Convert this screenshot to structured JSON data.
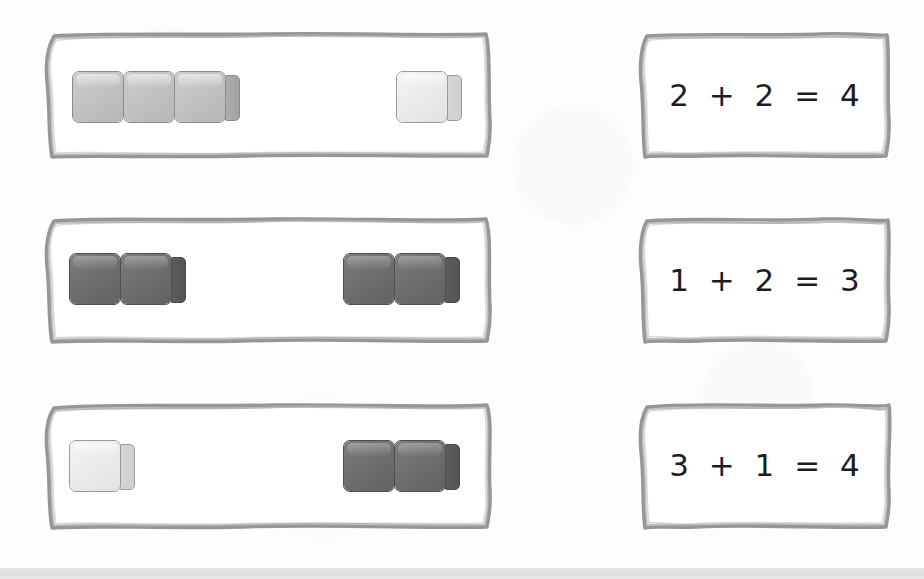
{
  "page": {
    "background_color": "#fdfdfd",
    "bottom_strip_color": "#e0e2e4",
    "sketch_border_color": "#8e9094",
    "text_color": "#1d1d1f"
  },
  "block_tones": {
    "light_label": "light-gray block",
    "light_color": "#ebebeb",
    "mid_label": "medium-gray block",
    "mid_color": "#c2c2c2",
    "dark_label": "dark-gray block",
    "dark_color": "#6f6f6f"
  },
  "rows": [
    {
      "id": "row-1",
      "blocks_box": {
        "name": "blocks-box-1",
        "groups": [
          {
            "name": "group-left",
            "count": 3,
            "tone": "mid",
            "count_label": "3"
          },
          {
            "name": "group-right",
            "count": 1,
            "tone": "light",
            "count_label": "1"
          }
        ]
      },
      "equation_box": {
        "name": "equation-box-1",
        "text": "2 + 2 = 4",
        "addend_a": "2",
        "addend_b": "2",
        "sum": "4"
      }
    },
    {
      "id": "row-2",
      "blocks_box": {
        "name": "blocks-box-2",
        "groups": [
          {
            "name": "group-left",
            "count": 2,
            "tone": "dark",
            "count_label": "2"
          },
          {
            "name": "group-right",
            "count": 2,
            "tone": "dark",
            "count_label": "2"
          }
        ]
      },
      "equation_box": {
        "name": "equation-box-2",
        "text": "1 + 2 = 3",
        "addend_a": "1",
        "addend_b": "2",
        "sum": "3"
      }
    },
    {
      "id": "row-3",
      "blocks_box": {
        "name": "blocks-box-3",
        "groups": [
          {
            "name": "group-left",
            "count": 1,
            "tone": "light",
            "count_label": "1"
          },
          {
            "name": "group-right",
            "count": 2,
            "tone": "dark",
            "count_label": "2"
          }
        ]
      },
      "equation_box": {
        "name": "equation-box-3",
        "text": "3 + 1 = 4",
        "addend_a": "3",
        "addend_b": "1",
        "sum": "4"
      }
    }
  ]
}
